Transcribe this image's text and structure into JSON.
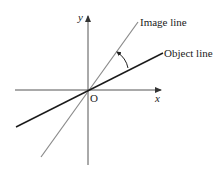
{
  "diagram": {
    "axes": {
      "x_label": "x",
      "y_label": "y",
      "origin_label": "O"
    },
    "lines": {
      "image_line": {
        "label": "Image line",
        "color": "#8a8a8a"
      },
      "object_line": {
        "label": "Object line",
        "color": "#1a1a1a"
      }
    },
    "angle_arrow": {
      "from": "Object line",
      "to": "Image line"
    },
    "axis_color": "#555555"
  }
}
